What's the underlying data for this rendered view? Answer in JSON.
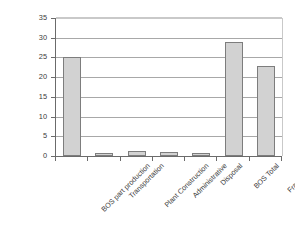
{
  "chart_data": {
    "type": "bar",
    "title": "",
    "xlabel": "",
    "ylabel": "GHG emissions (kg CO2 eq./ m2)",
    "categories": [
      "BOS part production",
      "Transportation",
      "Plant Construction",
      "Administrative",
      "Disposal",
      "BOS Total",
      "Frame Total"
    ],
    "values": [
      25.1,
      0.7,
      1.2,
      1.0,
      0.7,
      28.8,
      22.9
    ],
    "ylim": [
      0,
      35
    ],
    "ytick_labels": [
      "0",
      "5",
      "10",
      "15",
      "20",
      "25",
      "30",
      "35"
    ],
    "ytick_values": [
      0,
      5,
      10,
      15,
      20,
      25,
      30,
      35
    ],
    "grid": true,
    "grid_axis": "y",
    "legend": false,
    "legend_position": "none",
    "bar_fill_color": "#d2d2d2",
    "bar_border_color": "#7d7d7d",
    "axis_color": "#6b6b6b",
    "gridline_color": "#a8a8a8",
    "background_color": "#ffffff"
  }
}
